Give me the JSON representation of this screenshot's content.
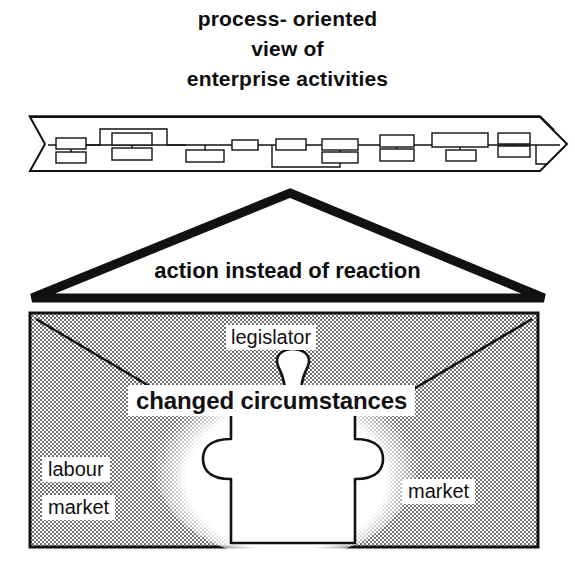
{
  "title": {
    "lines": [
      "process- oriented",
      "view of",
      "enterprise activities"
    ]
  },
  "process_band": {
    "name": "process-flow-banner",
    "shape": "right-pointing-arrow-banner",
    "top_edge": "hatched",
    "node_count": 22,
    "description": "network of linked small rectangles representing an enterprise process chain"
  },
  "triangle": {
    "label": "action instead of reaction",
    "shape": "wide-flat-triangle-outline"
  },
  "environment": {
    "fill": "stippled-gray",
    "labels": {
      "legislator": "legislator",
      "changed_circumstances": "changed circumstances",
      "labour": "labour",
      "labour_market": "market",
      "market": "market"
    },
    "puzzle_piece": "jigsaw-puzzle-piece"
  },
  "colors": {
    "ink": "#111111",
    "paper": "#ffffff",
    "stipple": "#6f6f6f"
  }
}
